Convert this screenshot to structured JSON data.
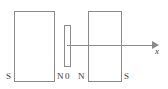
{
  "figure": {
    "type": "physics-diagram",
    "width": 168,
    "height": 89,
    "background_color": "#ffffff",
    "stroke_color": "#8a8a8a",
    "text_color": "#3a3a3a"
  },
  "magnets": {
    "left": {
      "name": "left-bar-magnet",
      "left_pole_label": "S",
      "right_pole_label": "N"
    },
    "right": {
      "name": "right-bar-magnet",
      "left_pole_label": "N",
      "right_pole_label": "S"
    }
  },
  "coil": {
    "name": "center-coil",
    "label": ""
  },
  "axis": {
    "origin_label": "0",
    "axis_label": "x",
    "direction": "right"
  }
}
